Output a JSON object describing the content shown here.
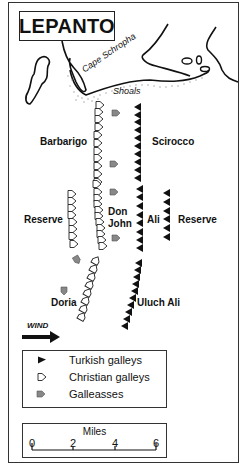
{
  "title": "LEPANTO",
  "map_labels": {
    "cape": "Cape Schropha",
    "shoals": "Shoals",
    "barbarigo": "Barbarigo",
    "scirocco": "Scirocco",
    "reserve_left": "Reserve",
    "don": "Don",
    "john": "John",
    "ali": "Ali",
    "reserve_right": "Reserve",
    "doria": "Doria",
    "uluch_ali": "Uluch Ali",
    "wind": "WIND"
  },
  "legend": {
    "items": [
      {
        "icon": "turkish-galley-icon",
        "label": "Turkish galleys"
      },
      {
        "icon": "christian-galley-icon",
        "label": "Christian galleys"
      },
      {
        "icon": "galleass-icon",
        "label": "Galleasses"
      }
    ]
  },
  "scale": {
    "title": "Miles",
    "ticks": [
      "0",
      "2",
      "4",
      "6"
    ]
  },
  "colors": {
    "ink": "#111111",
    "galleass": "#777777",
    "shoal_dots": "#999999"
  }
}
